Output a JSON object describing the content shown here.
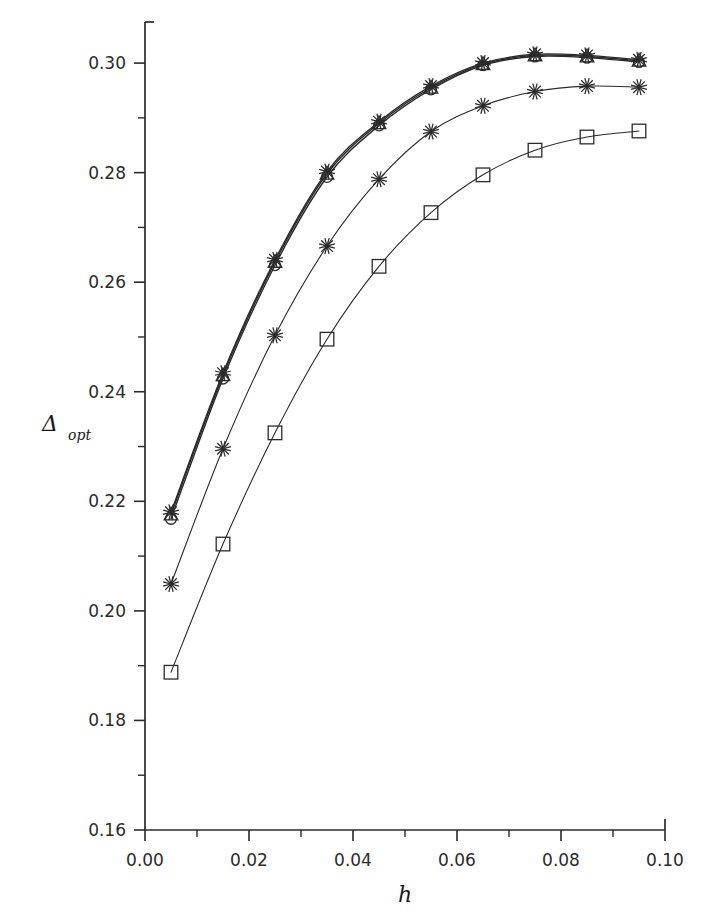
{
  "figure": {
    "background_color": "#ffffff",
    "line_color": "#2b2b2b",
    "thick_band_color": "#1a1a1a"
  },
  "chart_data": {
    "type": "line",
    "title": "",
    "subtitle": "",
    "xlabel": "h",
    "ylabel": "Δ",
    "ylabel_subscript": "opt",
    "xlim": [
      0.0,
      0.1
    ],
    "ylim": [
      0.16,
      0.3075
    ],
    "xticks": [
      0.0,
      0.02,
      0.04,
      0.06,
      0.08,
      0.1
    ],
    "xtick_labels": [
      "0.00",
      "0.02",
      "0.04",
      "0.06",
      "0.08",
      "0.10"
    ],
    "xminor_ticks": [
      0.01,
      0.03,
      0.05,
      0.07,
      0.09
    ],
    "yticks": [
      0.16,
      0.18,
      0.2,
      0.22,
      0.24,
      0.26,
      0.28,
      0.3
    ],
    "ytick_labels": [
      "0.16",
      "0.18",
      "0.20",
      "0.22",
      "0.24",
      "0.26",
      "0.28",
      "0.30"
    ],
    "yminor_ticks": [
      0.17,
      0.19,
      0.21,
      0.23,
      0.25,
      0.27,
      0.29
    ],
    "grid": false,
    "legend": false,
    "legend_position": "none",
    "x": [
      0.005,
      0.015,
      0.025,
      0.035,
      0.045,
      0.055,
      0.065,
      0.075,
      0.085,
      0.095
    ],
    "series": [
      {
        "name": "triangle-series",
        "marker": "triangle",
        "linewidth": 1.4,
        "values": [
          0.2176,
          0.243,
          0.2637,
          0.2798,
          0.289,
          0.2955,
          0.2998,
          0.3014,
          0.3012,
          0.3004
        ]
      },
      {
        "name": "circle-series",
        "marker": "circle",
        "linewidth": 1.4,
        "values": [
          0.2168,
          0.2424,
          0.2631,
          0.2792,
          0.2886,
          0.2952,
          0.2996,
          0.3012,
          0.301,
          0.3002
        ]
      },
      {
        "name": "star-overlap-series",
        "marker": "star",
        "linewidth": 1.4,
        "values": [
          0.218,
          0.2434,
          0.2641,
          0.2802,
          0.2893,
          0.2958,
          0.3,
          0.3016,
          0.3014,
          0.3006
        ]
      },
      {
        "name": "star-series",
        "marker": "star",
        "linewidth": 1.1,
        "values": [
          0.2049,
          0.2296,
          0.2503,
          0.2666,
          0.2788,
          0.2875,
          0.2922,
          0.2948,
          0.2958,
          0.2956
        ]
      },
      {
        "name": "square-series",
        "marker": "square",
        "linewidth": 1.1,
        "values": [
          0.1888,
          0.2122,
          0.2325,
          0.2496,
          0.2629,
          0.2727,
          0.2796,
          0.2841,
          0.2865,
          0.2876
        ]
      }
    ]
  }
}
